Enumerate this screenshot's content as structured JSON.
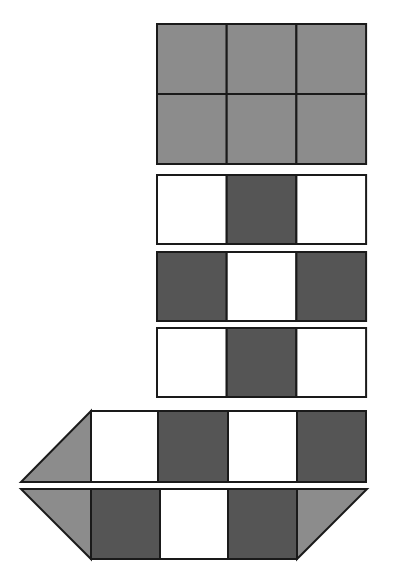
{
  "diagram": {
    "colors": {
      "background": "#ffffff",
      "light": "#ffffff",
      "medium": "#8c8c8c",
      "dark": "#555555",
      "stroke": "#1a1a1a"
    },
    "grid_block": {
      "rows": 2,
      "cols": 3,
      "fill": "medium"
    },
    "strips": [
      {
        "name": "strip-1",
        "cells": [
          "light",
          "dark",
          "light"
        ]
      },
      {
        "name": "strip-2",
        "cells": [
          "dark",
          "light",
          "dark"
        ]
      },
      {
        "name": "strip-3",
        "cells": [
          "light",
          "dark",
          "light"
        ]
      },
      {
        "name": "strip-4",
        "left_triangle": "medium",
        "cells": [
          "light",
          "dark",
          "light",
          "dark"
        ]
      },
      {
        "name": "strip-5",
        "left_triangle": "medium",
        "cells": [
          "dark",
          "light",
          "dark"
        ],
        "right_triangle": "medium"
      }
    ]
  }
}
